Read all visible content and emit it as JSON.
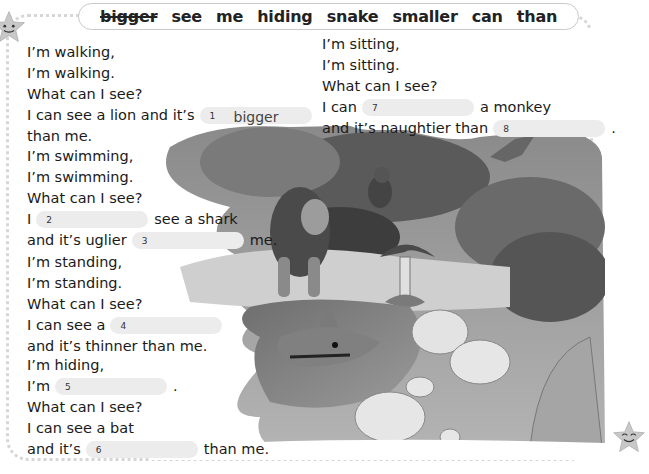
{
  "word_bank": {
    "words": [
      {
        "text": "bigger",
        "used": true
      },
      {
        "text": "see",
        "used": false
      },
      {
        "text": "me",
        "used": false
      },
      {
        "text": "hiding",
        "used": false
      },
      {
        "text": "snake",
        "used": false
      },
      {
        "text": "smaller",
        "used": false
      },
      {
        "text": "can",
        "used": false
      },
      {
        "text": "than",
        "used": false
      }
    ]
  },
  "verses": {
    "walking": {
      "l1": "I’m walking,",
      "l2": "I’m walking.",
      "l3": "What can I see?",
      "l4_pre": "I can see a lion and it’s",
      "gap_num": "1",
      "gap_answer": "bigger",
      "l5": "than me."
    },
    "swimming": {
      "l1": "I’m swimming,",
      "l2": "I’m swimming.",
      "l3": "What can I see?",
      "l4_pre": "I",
      "gap2_num": "2",
      "l4_post": "see a shark",
      "l5_pre": "and it’s uglier",
      "gap3_num": "3",
      "l5_post": "me."
    },
    "standing": {
      "l1": "I’m standing,",
      "l2": "I’m standing.",
      "l3": "What can I see?",
      "l4_pre": "I can see a",
      "gap_num": "4",
      "l5": "and it’s thinner than me."
    },
    "hiding": {
      "l1": "I’m hiding,",
      "l2_pre": "I’m",
      "gap5_num": "5",
      "l2_post": ".",
      "l3": "What can I see?",
      "l4": "I can see a bat",
      "l5_pre": "and it’s",
      "gap6_num": "6",
      "l5_post": "than me."
    },
    "sitting": {
      "l1": "I’m sitting,",
      "l2": "I’m sitting.",
      "l3": "What can I see?",
      "l4_pre": "I can",
      "gap7_num": "7",
      "l4_post": "a monkey",
      "l5_pre": "and it’s naughtier than",
      "gap8_num": "8",
      "l5_post": "."
    }
  },
  "illustration": {
    "description": "Jungle scene with a lion, monkey in a tree, bat, snake in a palm tree, shark in water and rocks"
  }
}
